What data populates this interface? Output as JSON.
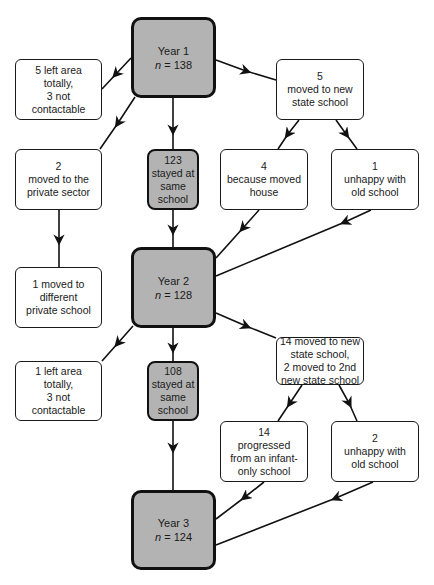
{
  "diagram": {
    "type": "flowchart",
    "colors": {
      "year_box_fill": "#b3b3b3",
      "stayed_box_fill": "#b3b3b3",
      "other_box_fill": "#ffffff",
      "line": "#111111"
    },
    "nodes": {
      "year1": {
        "title": "Year 1",
        "n_label": "n",
        "n_value": "= 138"
      },
      "left1": {
        "lines": [
          "5 left area",
          "totally,",
          "3 not",
          "contactable"
        ]
      },
      "newstate1": {
        "lines": [
          "5",
          "moved to new",
          "state school"
        ]
      },
      "private1": {
        "lines": [
          "2",
          "moved to the",
          "private sector"
        ]
      },
      "stayed1": {
        "lines": [
          "123",
          "stayed at",
          "same",
          "school"
        ]
      },
      "movedhouse": {
        "lines": [
          "4",
          "because moved",
          "house"
        ]
      },
      "unhappy1": {
        "lines": [
          "1",
          "unhappy with",
          "old school"
        ]
      },
      "private2": {
        "lines": [
          "1 moved to",
          "different",
          "private school"
        ]
      },
      "year2": {
        "title": "Year 2",
        "n_label": "n",
        "n_value": "= 128"
      },
      "left2": {
        "lines": [
          "1 left area",
          "totally,",
          "3 not",
          "contactable"
        ]
      },
      "stayed2": {
        "lines": [
          "108",
          "stayed at",
          "same",
          "school"
        ]
      },
      "newstate2": {
        "lines": [
          "14 moved to new",
          "state school,",
          "2 moved to 2nd",
          "new state school"
        ]
      },
      "progressed": {
        "lines": [
          "14",
          "progressed",
          "from an infant-",
          "only school"
        ]
      },
      "unhappy2": {
        "lines": [
          "2",
          "unhappy with",
          "old school"
        ]
      },
      "year3": {
        "title": "Year 3",
        "n_label": "n",
        "n_value": "= 124"
      }
    },
    "edges": [
      {
        "from": "year1",
        "to": "left1"
      },
      {
        "from": "year1",
        "to": "private1"
      },
      {
        "from": "year1",
        "to": "stayed1"
      },
      {
        "from": "year1",
        "to": "newstate1"
      },
      {
        "from": "newstate1",
        "to": "movedhouse"
      },
      {
        "from": "newstate1",
        "to": "unhappy1"
      },
      {
        "from": "private1",
        "to": "private2"
      },
      {
        "from": "stayed1",
        "to": "year2"
      },
      {
        "from": "movedhouse",
        "to": "year2"
      },
      {
        "from": "unhappy1",
        "to": "year2"
      },
      {
        "from": "year2",
        "to": "left2"
      },
      {
        "from": "year2",
        "to": "stayed2"
      },
      {
        "from": "year2",
        "to": "newstate2"
      },
      {
        "from": "newstate2",
        "to": "progressed"
      },
      {
        "from": "newstate2",
        "to": "unhappy2"
      },
      {
        "from": "stayed2",
        "to": "year3"
      },
      {
        "from": "progressed",
        "to": "year3"
      },
      {
        "from": "unhappy2",
        "to": "year3"
      }
    ]
  }
}
